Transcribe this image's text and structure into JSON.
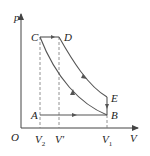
{
  "diagram": {
    "type": "p-V thermodynamic cycle",
    "axes": {
      "y_label": "p",
      "x_label": "V",
      "origin_label": "O"
    },
    "points": [
      {
        "label": "A",
        "x": 40,
        "y": 115
      },
      {
        "label": "B",
        "x": 107,
        "y": 115
      },
      {
        "label": "C",
        "x": 40,
        "y": 37
      },
      {
        "label": "D",
        "x": 59,
        "y": 37
      },
      {
        "label": "E",
        "x": 107,
        "y": 97
      }
    ],
    "x_ticks": [
      {
        "label": "V2",
        "main": "V",
        "sub": "2",
        "x": 40
      },
      {
        "label": "V'",
        "main": "V'",
        "sub": "",
        "x": 59
      },
      {
        "label": "V1",
        "main": "V",
        "sub": "1",
        "x": 107
      }
    ],
    "processes": [
      {
        "from": "A",
        "to": "B",
        "kind": "isobaric",
        "direction": "right"
      },
      {
        "from": "B",
        "to": "C",
        "kind": "curve (adiabatic compression)",
        "direction": "up-left"
      },
      {
        "from": "C",
        "to": "D",
        "kind": "isobaric",
        "direction": "right"
      },
      {
        "from": "D",
        "to": "E",
        "kind": "curve (adiabatic expansion)",
        "direction": "down-right"
      },
      {
        "from": "E",
        "to": "B",
        "kind": "isochoric",
        "direction": "down"
      }
    ],
    "colors": {
      "line": "#555555",
      "dashed": "#777777",
      "text": "#222222",
      "background": "#ffffff"
    }
  }
}
